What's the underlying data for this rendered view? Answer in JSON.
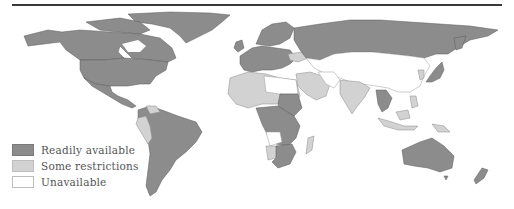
{
  "map": {
    "type": "world choropleth",
    "colors": {
      "readily_available": "#8c8c8c",
      "some_restrictions": "#d2d2d2",
      "unavailable": "#ffffff"
    },
    "regions": {
      "readily_available": [
        "North America",
        "Greenland",
        "Mexico",
        "South America (most)",
        "Western Europe",
        "Scandinavia",
        "Russia",
        "Japan",
        "Australia",
        "New Zealand",
        "Southern Africa (parts)",
        "Central/East Africa (parts)",
        "Sudan",
        "Southeast Asia (parts)"
      ],
      "some_restrictions": [
        "North Africa (parts)",
        "West Africa (parts)",
        "Middle East (parts)",
        "India",
        "Ukraine",
        "Peru",
        "Namibia",
        "Madagascar",
        "Indonesia",
        "Papua New Guinea"
      ],
      "unavailable": [
        "Libya",
        "Egypt",
        "Angola",
        "China",
        "Mongolia",
        "Central Asia",
        "Iran"
      ]
    }
  },
  "legend": {
    "items": [
      {
        "label": "Readily available",
        "color": "#8c8c8c"
      },
      {
        "label": "Some restrictions",
        "color": "#d2d2d2"
      },
      {
        "label": "Unavailable",
        "color": "#ffffff"
      }
    ]
  }
}
